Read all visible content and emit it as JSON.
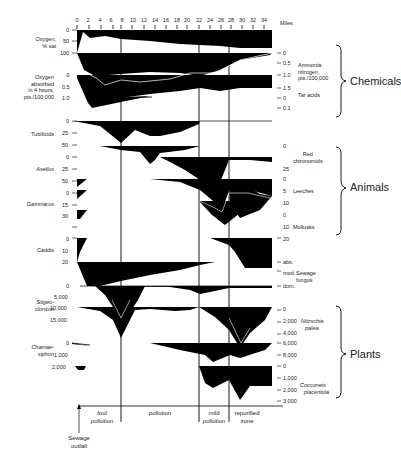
{
  "axis": {
    "unit_label": "Miles",
    "ticks": [
      "0",
      "2",
      "4",
      "6",
      "8",
      "10",
      "12",
      "14",
      "16",
      "18",
      "20",
      "22",
      "24",
      "26",
      "28",
      "30",
      "32",
      "34"
    ]
  },
  "left_labels": {
    "oxygen": "Oxygen,",
    "oxygen2": "% sat",
    "oxy_absorbed1": "Oxygen",
    "oxy_absorbed2": "absorbed",
    "oxy_absorbed3": "in 4 hours,",
    "oxy_absorbed4": "pts./100,000",
    "tubificids": "Tubificids",
    "asellus": "Asellus",
    "gammarus": "Gammarus",
    "caddis": "Caddis",
    "stigeo1": "Stigeo-",
    "stigeo2": "clonium",
    "chamae1": "Chamae-",
    "chamae2": "siphon"
  },
  "left_ticks": {
    "oxy": [
      "0",
      "50",
      "100"
    ],
    "oxabs": [
      ".0",
      "0.5",
      "1.0"
    ],
    "tubi": [
      "0",
      "25",
      "50"
    ],
    "asellus": [
      "0",
      "25",
      "50"
    ],
    "gammarus": [
      "0",
      "15",
      "30"
    ],
    "caddis": [
      "0",
      "10",
      "20"
    ],
    "stigeo": [
      "0",
      "5,000",
      "10,000",
      "15,000"
    ],
    "chamae": [
      "0",
      "1,000",
      "2,000"
    ]
  },
  "right_ticks": {
    "ammonia": [
      "0",
      "0.5",
      "1.0",
      "1.5"
    ],
    "tar": [
      "0",
      "0.1"
    ],
    "chiro": [
      "0",
      "25"
    ],
    "leeches": [
      "0",
      "5",
      "10"
    ],
    "mollusks": [
      "0",
      "10",
      "20"
    ],
    "fungus": [
      "abs.",
      "mod.",
      "dom."
    ],
    "nitzschia": [
      "0",
      "2,000",
      "4,000",
      "6,000",
      "8,000"
    ],
    "cocconeis": [
      "0",
      "1,000",
      "2,000",
      "3,000"
    ]
  },
  "right_labels": {
    "ammonia1": "Ammonia",
    "ammonia2": "nitrogen,",
    "ammonia3": "pts./100,000",
    "tar": "Tar acids",
    "chiro1": "Red",
    "chiro2": "chironomids",
    "leeches": "Leeches",
    "mollusks": "Mollusks",
    "fungus1": "Sewage",
    "fungus2": "fungus",
    "nitzschia1": "Nitzschia",
    "nitzschia2": "palea",
    "cocconeis1": "Cocconeis",
    "cocconeis2": "placentula"
  },
  "groups": {
    "chemicals": "Chemicals",
    "animals": "Animals",
    "plants": "Plants"
  },
  "zones": {
    "foul1": "foul",
    "foul2": "pollution",
    "pollution": "pollution",
    "mild1": "mild",
    "mild2": "pollution",
    "repur1": "repurified",
    "repur2": "zone"
  },
  "outfall": {
    "line1": "Sewage",
    "line2": "outfall"
  },
  "colors": {
    "fill": "#000000",
    "background": "#ffffff"
  }
}
